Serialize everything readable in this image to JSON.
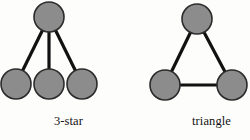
{
  "page": {
    "background_color": "#fdfdfc",
    "width": 250,
    "height": 140
  },
  "style": {
    "node_fill": "#8c8c8c",
    "node_stroke": "#2b2b2b",
    "node_stroke_width": 1.6,
    "edge_color": "#111111",
    "edge_width": 3.2,
    "label_color": "#111111"
  },
  "figures": [
    {
      "id": "3-star",
      "caption": "3-star",
      "node_radius": 15,
      "nodes": [
        {
          "id": "center",
          "label": "",
          "cx": 49,
          "cy": 17
        },
        {
          "id": "leaf-1",
          "label": "",
          "cx": 16,
          "cy": 84
        },
        {
          "id": "leaf-2",
          "label": "",
          "cx": 49,
          "cy": 84
        },
        {
          "id": "leaf-3",
          "label": "",
          "cx": 82,
          "cy": 84
        }
      ],
      "edges": [
        {
          "from": "center",
          "to": "leaf-1"
        },
        {
          "from": "center",
          "to": "leaf-2"
        },
        {
          "from": "center",
          "to": "leaf-3"
        }
      ]
    },
    {
      "id": "triangle",
      "caption": "triangle",
      "node_radius": 15,
      "nodes": [
        {
          "id": "apex",
          "label": "",
          "cx": 72,
          "cy": 19
        },
        {
          "id": "left",
          "label": "",
          "cx": 40,
          "cy": 85
        },
        {
          "id": "right",
          "label": "",
          "cx": 107,
          "cy": 85
        }
      ],
      "edges": [
        {
          "from": "apex",
          "to": "left"
        },
        {
          "from": "apex",
          "to": "right"
        },
        {
          "from": "left",
          "to": "right"
        }
      ]
    }
  ]
}
